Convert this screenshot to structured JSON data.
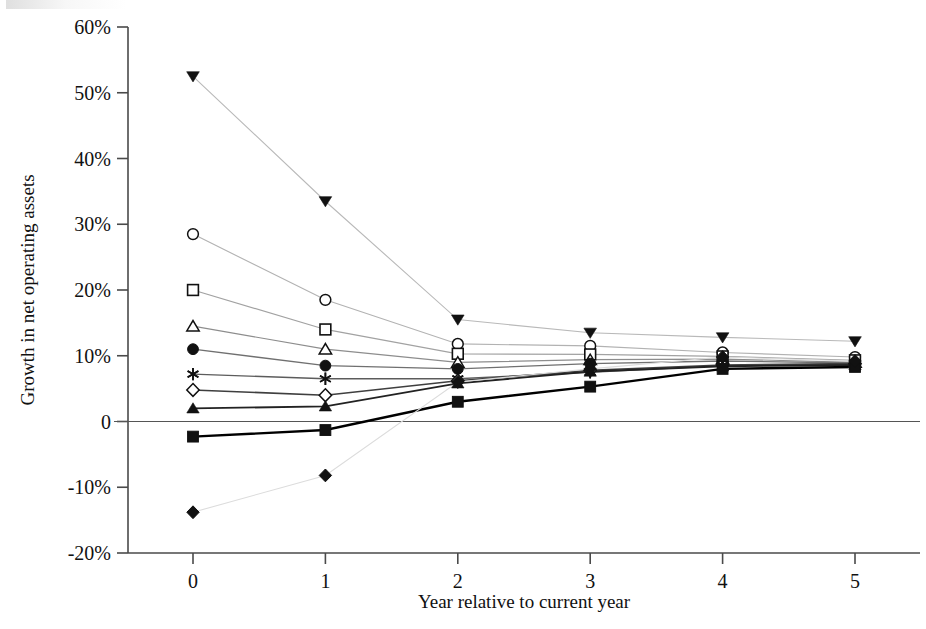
{
  "chart_data": {
    "type": "line",
    "title": "",
    "xlabel": "Year relative to current year",
    "ylabel": "Growth in net operating assets",
    "x": [
      0,
      1,
      2,
      3,
      4,
      5
    ],
    "categories": [
      "0",
      "1",
      "2",
      "3",
      "4",
      "5"
    ],
    "xtick_labels": [
      "0",
      "1",
      "2",
      "3",
      "4",
      "5"
    ],
    "ytick_labels": [
      "60%",
      "50%",
      "40%",
      "30%",
      "20%",
      "10%",
      "0",
      "-10%",
      "-20%"
    ],
    "ytick_values": [
      60,
      50,
      40,
      30,
      20,
      10,
      0,
      -10,
      -20
    ],
    "ylim": [
      -20,
      60
    ],
    "xlim": [
      -0.22,
      5.22
    ],
    "grid": false,
    "legend": "none",
    "units": "percent",
    "series": [
      {
        "name": "decile-10",
        "marker": "filled-triangle-down",
        "line_color": "#b9b9b9",
        "line_width": 1.1,
        "values": [
          52.5,
          33.5,
          15.5,
          13.5,
          12.8,
          12.2
        ]
      },
      {
        "name": "decile-9",
        "marker": "open-circle",
        "line_color": "#b2b2b2",
        "line_width": 1.1,
        "values": [
          28.5,
          18.5,
          11.8,
          11.5,
          10.5,
          9.8
        ]
      },
      {
        "name": "decile-8",
        "marker": "open-square",
        "line_color": "#a2a2a2",
        "line_width": 1.2,
        "values": [
          20.0,
          14.0,
          10.3,
          10.2,
          9.9,
          9.3
        ]
      },
      {
        "name": "decile-7",
        "marker": "open-triangle-up",
        "line_color": "#8d8d8d",
        "line_width": 1.2,
        "values": [
          14.5,
          11.0,
          9.0,
          9.4,
          9.5,
          9.0
        ]
      },
      {
        "name": "decile-6",
        "marker": "filled-circle",
        "line_color": "#707070",
        "line_width": 1.4,
        "values": [
          11.0,
          8.5,
          8.0,
          8.8,
          9.2,
          8.9
        ]
      },
      {
        "name": "decile-5",
        "marker": "asterisk",
        "line_color": "#5c5c5c",
        "line_width": 1.4,
        "values": [
          7.2,
          6.5,
          6.5,
          7.5,
          8.5,
          8.7
        ]
      },
      {
        "name": "decile-4",
        "marker": "open-diamond",
        "line_color": "#3f3f3f",
        "line_width": 1.6,
        "values": [
          4.8,
          4.0,
          6.2,
          7.8,
          8.6,
          8.8
        ]
      },
      {
        "name": "decile-3",
        "marker": "filled-triangle-up",
        "line_color": "#222222",
        "line_width": 1.9,
        "values": [
          2.0,
          2.3,
          5.8,
          7.6,
          8.4,
          8.6
        ]
      },
      {
        "name": "decile-2",
        "marker": "filled-square",
        "line_color": "#000000",
        "line_width": 2.4,
        "values": [
          -2.3,
          -1.3,
          3.0,
          5.3,
          8.0,
          8.3
        ]
      },
      {
        "name": "decile-1",
        "marker": "filled-diamond",
        "line_color": "#dcdcdc",
        "line_width": 1.1,
        "values": [
          -13.8,
          -8.2,
          6.0,
          8.0,
          9.8,
          9.2
        ]
      }
    ]
  },
  "geometry": {
    "plot_left": 128,
    "plot_right": 920,
    "plot_top": 27,
    "plot_bottom": 553,
    "x_first_tick": 193,
    "x_tick_spacing": 132.4
  }
}
